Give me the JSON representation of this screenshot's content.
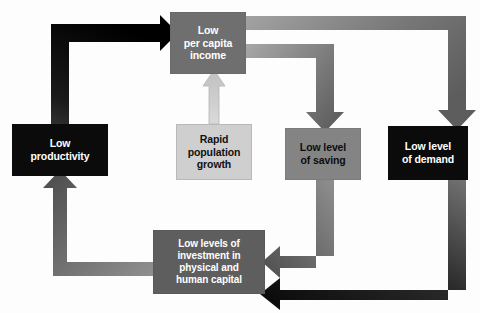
{
  "diagram": {
    "background_color": "#fdfdfd",
    "nodes": [
      {
        "id": "income",
        "label": "Low\nper capita\nincome",
        "lines": [
          "Low",
          "per capita",
          "income"
        ],
        "fill": "#6f6f6f",
        "text_color": "#ffffff"
      },
      {
        "id": "productivity",
        "label": "Low\nproductivity",
        "lines": [
          "Low",
          "productivity"
        ],
        "fill": "#0b0b0b",
        "text_color": "#ffffff"
      },
      {
        "id": "population",
        "label": "Rapid\npopulation\ngrowth",
        "lines": [
          "Rapid",
          "population",
          "growth"
        ],
        "fill": "#cfcfcf",
        "text_color": "#111111"
      },
      {
        "id": "saving",
        "label": "Low level\nof saving",
        "lines": [
          "Low level",
          "of saving"
        ],
        "fill": "#848484",
        "text_color": "#0d0d0d"
      },
      {
        "id": "demand",
        "label": "Low level\nof demand",
        "lines": [
          "Low level",
          "of demand"
        ],
        "fill": "#0b0b0b",
        "text_color": "#ffffff"
      },
      {
        "id": "investment",
        "label": "Low levels of\ninvestment in\nphysical and\nhuman capital",
        "lines": [
          "Low levels of",
          "investment in",
          "physical and",
          "human capital"
        ],
        "fill": "#5e5e5e",
        "text_color": "#ffffff"
      }
    ],
    "connectors": [
      {
        "id": "productivity-to-income",
        "from": "productivity",
        "to": "income",
        "color_start": "#4a4a4a",
        "color_end": "#000000",
        "style": "thick-elbow-right-arrow"
      },
      {
        "id": "income-to-demand",
        "from": "income",
        "to": "demand",
        "color_start": "#9a9a9a",
        "color_end": "#5a5a5a",
        "style": "elbow-down-arrow"
      },
      {
        "id": "income-to-saving",
        "from": "income",
        "to": "saving",
        "color_start": "#9a9a9a",
        "color_end": "#5a5a5a",
        "style": "elbow-down-arrow"
      },
      {
        "id": "population-to-income",
        "from": "population",
        "to": "income",
        "color_start": "#d6d6d6",
        "color_end": "#c2c2c2",
        "style": "up-arrow-outlined"
      },
      {
        "id": "saving-to-investment",
        "from": "saving",
        "to": "investment",
        "color_start": "#8d8d8d",
        "color_end": "#4f4f4f",
        "style": "elbow-left-arrow"
      },
      {
        "id": "demand-to-investment",
        "from": "demand",
        "to": "investment",
        "color_start": "#6b6b6b",
        "color_end": "#000000",
        "style": "elbow-left-arrow"
      },
      {
        "id": "investment-to-productivity",
        "from": "investment",
        "to": "productivity",
        "color_start": "#8a8a8a",
        "color_end": "#4a4a4a",
        "style": "elbow-up-arrow"
      }
    ]
  }
}
